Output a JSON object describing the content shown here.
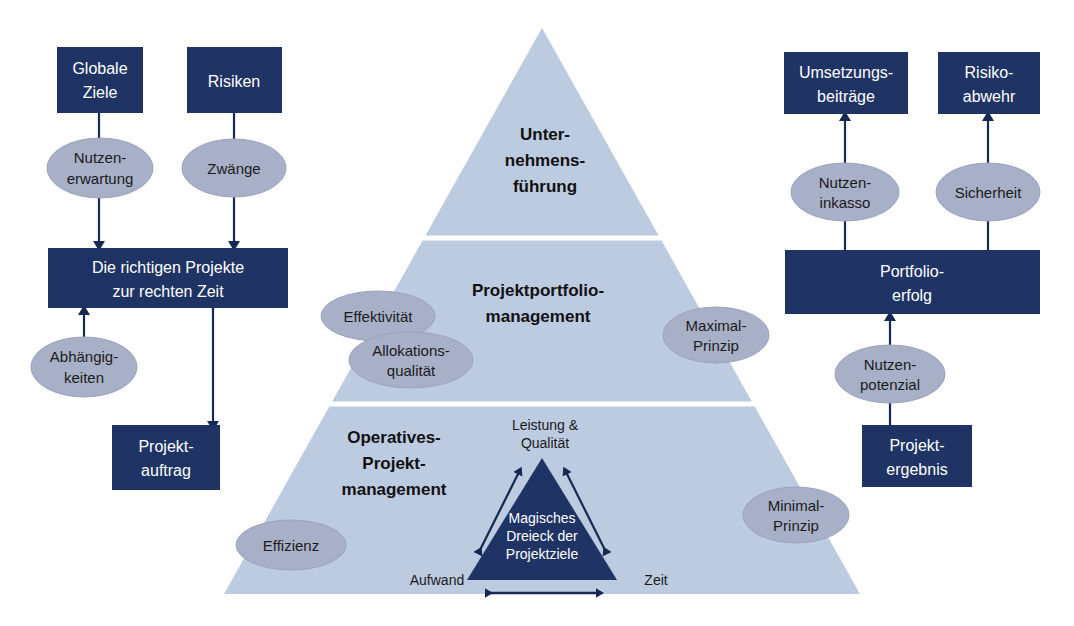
{
  "diagram": {
    "colors": {
      "box_fill": "#1f3465",
      "box_text": "#ffffff",
      "oval_fill": "#a8b0c8",
      "oval_stroke": "#9aa3bd",
      "pyramid_fill": "#bccbe0",
      "pyramid_divider": "#ffffff",
      "inner_triangle_fill": "#1f3465",
      "arrow": "#152a52",
      "background": "#ffffff",
      "text_dark": "#1a1a1a"
    },
    "pyramid": {
      "tiers": [
        {
          "id": "tier-top",
          "label_lines": [
            "Unter-",
            "nehmens-",
            "führung"
          ]
        },
        {
          "id": "tier-middle",
          "label_lines": [
            "Projektportfolio-",
            "management"
          ]
        },
        {
          "id": "tier-bottom",
          "label_lines": [
            "Operatives-",
            "Projekt-",
            "management"
          ]
        }
      ],
      "inner_triangle": {
        "label_lines": [
          "Magisches",
          "Dreieck der",
          "Projektziele"
        ],
        "corner_labels": {
          "top": [
            "Leistung &",
            "Qualität"
          ],
          "bottom_left": "Aufwand",
          "bottom_right": "Zeit"
        }
      }
    },
    "left_flow": {
      "boxes": [
        {
          "id": "globale-ziele",
          "lines": [
            "Globale",
            "Ziele"
          ]
        },
        {
          "id": "risiken",
          "lines": [
            "Risiken"
          ]
        },
        {
          "id": "richtige-projekte",
          "lines": [
            "Die richtigen Projekte",
            "zur rechten Zeit"
          ]
        },
        {
          "id": "projektauftrag",
          "lines": [
            "Projekt-",
            "auftrag"
          ]
        }
      ],
      "ovals": [
        {
          "id": "nutzenerwartung",
          "lines": [
            "Nutzen-",
            "erwartung"
          ]
        },
        {
          "id": "zwaenge",
          "lines": [
            "Zwänge"
          ]
        },
        {
          "id": "abhaengigkeiten",
          "lines": [
            "Abhängig-",
            "keiten"
          ]
        }
      ]
    },
    "right_flow": {
      "boxes": [
        {
          "id": "umsetzungsbeitraege",
          "lines": [
            "Umsetzungs-",
            "beiträge"
          ]
        },
        {
          "id": "risikoabwehr",
          "lines": [
            "Risiko-",
            "abwehr"
          ]
        },
        {
          "id": "portfolioerfolg",
          "lines": [
            "Portfolio-",
            "erfolg"
          ]
        },
        {
          "id": "projektergebnis",
          "lines": [
            "Projekt-",
            "ergebnis"
          ]
        }
      ],
      "ovals": [
        {
          "id": "nutzeninkasso",
          "lines": [
            "Nutzen-",
            "inkasso"
          ]
        },
        {
          "id": "sicherheit",
          "lines": [
            "Sicherheit"
          ]
        },
        {
          "id": "nutzenpotenzial",
          "lines": [
            "Nutzen-",
            "potenzial"
          ]
        }
      ]
    },
    "pyramid_ovals": [
      {
        "id": "effektivitaet",
        "lines": [
          "Effektivität"
        ]
      },
      {
        "id": "allokationsqualitaet",
        "lines": [
          "Allokations-",
          "qualität"
        ]
      },
      {
        "id": "maximal-prinzip",
        "lines": [
          "Maximal-",
          "Prinzip"
        ]
      },
      {
        "id": "effizienz",
        "lines": [
          "Effizienz"
        ]
      },
      {
        "id": "minimal-prinzip",
        "lines": [
          "Minimal-",
          "Prinzip"
        ]
      }
    ]
  }
}
